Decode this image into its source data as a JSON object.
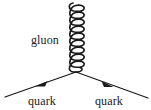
{
  "figure": {
    "type": "feynman-diagram",
    "background_color": "#ffffff",
    "stroke_color": "#1a1a1a",
    "width": 151,
    "height": 110
  },
  "labels": {
    "gluon": "gluon",
    "quark_left": "quark",
    "quark_right": "quark"
  },
  "geometry": {
    "vertex": {
      "x": 76,
      "y": 72
    },
    "gluon_propagator": {
      "x_center": 77,
      "y_top": 2,
      "y_bottom": 72,
      "coil_radius_x": 9,
      "loops": 10
    },
    "quark_line_left": {
      "x1": 76,
      "y1": 72,
      "x2": 5,
      "y2": 97
    },
    "quark_line_right": {
      "x1": 76,
      "y1": 72,
      "x2": 148,
      "y2": 98
    },
    "arrow_left": {
      "x": 42,
      "y": 84,
      "direction": "down-left"
    },
    "arrow_right": {
      "x": 107,
      "y": 84,
      "direction": "down-right"
    }
  },
  "label_positions": {
    "gluon": {
      "x": 31,
      "y": 44
    },
    "quark_left": {
      "x": 28,
      "y": 105
    },
    "quark_right": {
      "x": 95,
      "y": 105
    }
  }
}
